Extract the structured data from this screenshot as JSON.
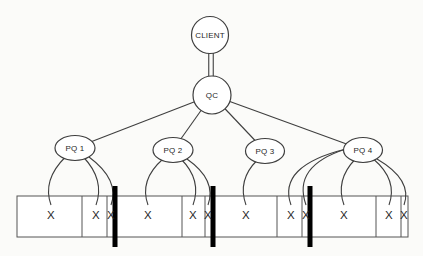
{
  "figure": {
    "background": "#fbfbf9",
    "line_color": "#3f3f3f",
    "band_line_color": "#555555",
    "bar_color": "#000000",
    "text_color": "#1f1f1f",
    "nodes": [
      {
        "id": "client",
        "label": "CLIENT",
        "shape": "circle",
        "cx": 210,
        "cy": 35,
        "rx": 18.5,
        "ry": 18.5,
        "font": 8
      },
      {
        "id": "qc",
        "label": "QC",
        "shape": "circle",
        "cx": 212,
        "cy": 95,
        "rx": 19,
        "ry": 19,
        "font": 8
      },
      {
        "id": "pq1",
        "label": "PQ 1",
        "shape": "ellipse",
        "cx": 75,
        "cy": 148,
        "rx": 20,
        "ry": 12.5,
        "font": 8
      },
      {
        "id": "pq2",
        "label": "PQ 2",
        "shape": "ellipse",
        "cx": 173,
        "cy": 150,
        "rx": 20,
        "ry": 12.5,
        "font": 8
      },
      {
        "id": "pq3",
        "label": "PQ 3",
        "shape": "ellipse",
        "cx": 265,
        "cy": 151,
        "rx": 19.5,
        "ry": 12.5,
        "font": 8
      },
      {
        "id": "pq4",
        "label": "PQ 4",
        "shape": "ellipse",
        "cx": 363,
        "cy": 150,
        "rx": 19.5,
        "ry": 12.5,
        "font": 8
      }
    ],
    "double_link": {
      "from": "client",
      "to": "qc",
      "gap": 4.5
    },
    "edges": [
      {
        "from": "qc",
        "to": "pq1"
      },
      {
        "from": "qc",
        "to": "pq2"
      },
      {
        "from": "qc",
        "to": "pq3"
      },
      {
        "from": "qc",
        "to": "pq4"
      }
    ],
    "band": {
      "x": 17,
      "y": 196,
      "width": 391,
      "height": 41,
      "dividers_x": [
        82,
        107,
        182,
        205,
        277,
        302,
        376,
        401
      ]
    },
    "partition_bars": {
      "xs": [
        115,
        213,
        310
      ],
      "y_top": 186,
      "y_bottom": 247,
      "width": 5
    },
    "mark_y": 214,
    "mark_font": 11.5,
    "x_marks": [
      {
        "id": "m1",
        "x": 51,
        "label": "X",
        "owner": "pq1"
      },
      {
        "id": "m2",
        "x": 96,
        "label": "X",
        "owner": "pq1"
      },
      {
        "id": "m3",
        "x": 111,
        "label": "X",
        "owner": "pq1"
      },
      {
        "id": "m4",
        "x": 148,
        "label": "X",
        "owner": "pq2"
      },
      {
        "id": "m5",
        "x": 193,
        "label": "X",
        "owner": "pq2"
      },
      {
        "id": "m6",
        "x": 208,
        "label": "X",
        "owner": "pq2"
      },
      {
        "id": "m7",
        "x": 246,
        "label": "X",
        "owner": "pq3"
      },
      {
        "id": "m8",
        "x": 291,
        "label": "X",
        "owner": "pq4",
        "sweep": true
      },
      {
        "id": "m9",
        "x": 306,
        "label": "X",
        "owner": "pq4",
        "sweep": true
      },
      {
        "id": "m10",
        "x": 344,
        "label": "X",
        "owner": "pq4"
      },
      {
        "id": "m11",
        "x": 389,
        "label": "X",
        "owner": "pq4"
      },
      {
        "id": "m12",
        "x": 404,
        "label": "X",
        "owner": "pq4"
      }
    ]
  }
}
